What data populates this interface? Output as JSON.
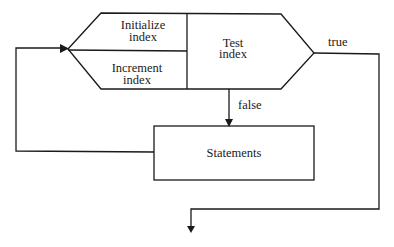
{
  "diagram": {
    "type": "flowchart",
    "title": "",
    "nodes": [
      {
        "id": "init",
        "label_lines": [
          "Initialize",
          "index"
        ],
        "shape": "hexagon-section"
      },
      {
        "id": "incr",
        "label_lines": [
          "Increment",
          "index"
        ],
        "shape": "hexagon-section"
      },
      {
        "id": "test",
        "label_lines": [
          "Test",
          "index"
        ],
        "shape": "hexagon-section"
      },
      {
        "id": "stmts",
        "label": "Statements",
        "shape": "rectangle"
      }
    ],
    "edges": [
      {
        "from": "test",
        "to": "stmts",
        "label": "false"
      },
      {
        "from": "test",
        "to": "exit",
        "label": "true"
      },
      {
        "from": "stmts",
        "to": "incr",
        "label": ""
      }
    ],
    "labels": {
      "init_line1": "Initialize",
      "init_line2": "index",
      "incr_line1": "Increment",
      "incr_line2": "index",
      "test_line1": "Test",
      "test_line2": "index",
      "statements": "Statements",
      "false_label": "false",
      "true_label": "true"
    },
    "colors": {
      "stroke": "#1a1a1a",
      "background": "#ffffff"
    }
  }
}
